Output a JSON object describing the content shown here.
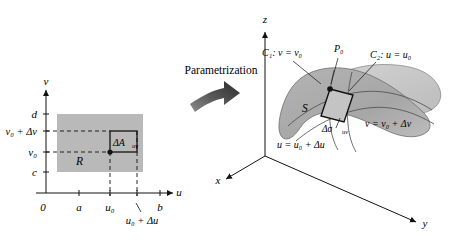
{
  "figure": {
    "caption_middle": "Parametrization",
    "arrow_icon": "curved-arrow-right-icon"
  },
  "uv_plane": {
    "axis_u_label": "u",
    "axis_v_label": "v",
    "origin_label": "0",
    "region_label": "R",
    "patch_label": "ΔA",
    "patch_sub": "uv",
    "u_ticks": [
      "a",
      "u₀",
      "b"
    ],
    "u_tick_delta": "u₀ + Δu",
    "v_ticks": [
      "c",
      "d"
    ],
    "v_tick_v0": "v₀",
    "v_tick_delta": "v₀ + Δv",
    "region_fill": "#b9b9b9"
  },
  "surface": {
    "axis_x_label": "x",
    "axis_y_label": "y",
    "axis_z_label": "z",
    "surface_label": "S",
    "point_label": "P₀",
    "curve1_label": "C₁: v = v₀",
    "curve2_label": "C₂: u = u₀",
    "edge_v_label": "v = v₀ + Δv",
    "edge_u_label": "u = u₀ + Δu",
    "patch_label": "Δσ",
    "patch_sub": "uv",
    "fill_front": "#b0b0b0",
    "fill_back": "#cfcfcf"
  }
}
